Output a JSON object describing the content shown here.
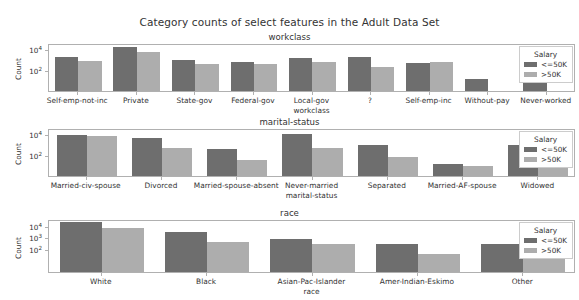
{
  "figure": {
    "title": "Category counts of select features in the Adult Data Set",
    "ylabel": "Count",
    "legend_title": "Salary",
    "series_names": [
      "<=50K",
      ">50K"
    ],
    "colors": {
      "series_0": "#6e6e6e",
      "series_1": "#adadad",
      "axis": "#b0b0b0",
      "text": "#333333",
      "background": "#ffffff"
    }
  },
  "chart_data": [
    {
      "type": "bar",
      "title": "workclass",
      "xlabel": "workclass",
      "ylabel": "Count",
      "yscale": "log",
      "ylim": [
        1,
        40000
      ],
      "yticks": [
        100,
        10000
      ],
      "ytick_labels": [
        "10²",
        "10⁴"
      ],
      "grid": false,
      "legend_position": "upper right",
      "categories": [
        "Self-emp-not-inc",
        "Private",
        "State-gov",
        "Federal-gov",
        "Local-gov",
        "?",
        "Self-emp-inc",
        "Without-pay",
        "Never-worked"
      ],
      "series": [
        {
          "name": "<=50K",
          "values": [
            1817,
            17733,
            945,
            589,
            1476,
            1645,
            494,
            14,
            7
          ]
        },
        {
          "name": ">50K",
          "values": [
            724,
            4963,
            353,
            371,
            617,
            191,
            622,
            0,
            0
          ]
        }
      ]
    },
    {
      "type": "bar",
      "title": "marital-status",
      "xlabel": "marital-status",
      "ylabel": "Count",
      "yscale": "log",
      "ylim": [
        1,
        40000
      ],
      "yticks": [
        100,
        10000
      ],
      "ytick_labels": [
        "10²",
        "10⁴"
      ],
      "grid": false,
      "legend_position": "upper right",
      "categories": [
        "Married-civ-spouse",
        "Divorced",
        "Married-spouse-absent",
        "Never-married",
        "Separated",
        "Married-AF-spouse",
        "Widowed"
      ],
      "series": [
        {
          "name": "<=50K",
          "values": [
            8284,
            3980,
            384,
            10192,
            959,
            13,
            908
          ]
        },
        {
          "name": ">50K",
          "values": [
            6692,
            463,
            34,
            491,
            66,
            10,
            85
          ]
        }
      ]
    },
    {
      "type": "bar",
      "title": "race",
      "xlabel": "race",
      "ylabel": "Count",
      "yscale": "log",
      "ylim": [
        1,
        40000
      ],
      "yticks": [
        100,
        1000,
        10000
      ],
      "ytick_labels": [
        "10²",
        "10³",
        "10⁴"
      ],
      "grid": false,
      "legend_position": "upper right",
      "categories": [
        "White",
        "Black",
        "Asian-Pac-Islander",
        "Amer-Indian-Eskimo",
        "Other"
      ],
      "series": [
        {
          "name": "<=50K",
          "values": [
            20699,
            2737,
            763,
            275,
            246
          ]
        },
        {
          "name": ">50K",
          "values": [
            7117,
            387,
            276,
            36,
            25
          ]
        }
      ]
    }
  ],
  "subplot_geometry": [
    {
      "axes_top": 44,
      "axes_height": 48,
      "sp_title_top": 32,
      "xlabel_dy": 18
    },
    {
      "axes_top": 129,
      "axes_height": 48,
      "sp_title_top": 117,
      "xlabel_dy": 18
    },
    {
      "axes_top": 220,
      "axes_height": 53,
      "sp_title_top": 208,
      "xlabel_dy": 18
    }
  ]
}
